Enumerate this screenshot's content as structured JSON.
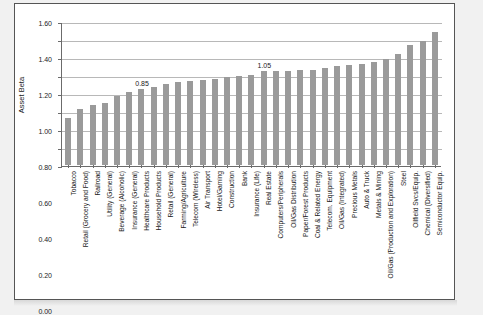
{
  "chart_data": {
    "type": "bar",
    "title": "",
    "xlabel": "",
    "ylabel": "Asset Beta",
    "ylim": [
      0.0,
      1.6
    ],
    "ytick_labels": [
      "0.00",
      "0.20",
      "0.40",
      "0.60",
      "0.80",
      "1.00",
      "1.20",
      "1.40",
      "1.60"
    ],
    "ytick_values": [
      0.0,
      0.2,
      0.4,
      0.6,
      0.8,
      1.0,
      1.2,
      1.4,
      1.6
    ],
    "grid": true,
    "legend": "none",
    "bar_color": "#9a9a9a",
    "categories": [
      "Tobacco",
      "Retail (Grocery and Food)",
      "Railroad",
      "Utility (General)",
      "Beverage (Alcoholic)",
      "Insurance (General)",
      "Healthcare Products",
      "Household Products",
      "Retail (General)",
      "Farming/Agriculture",
      "Telecom (Wireless)",
      "Air Transport",
      "Hotel/Gaming",
      "Construction",
      "Bank",
      "Insurance (Life)",
      "Real Estate",
      "Computers/Peripherals",
      "Oil/Gas Distribution",
      "Paper/Forest Products",
      "Coal & Related Energy",
      "Telecom. Equipment",
      "Oil/Gas (Integrated)",
      "Precious Metals",
      "Auto & Truck",
      "Metals & Mining",
      "Oil/Gas (Production and Exploration)",
      "Steel",
      "Oilfield Svcs/Equip.",
      "Chemical (Diversified)",
      "Semiconductor Equip."
    ],
    "values": [
      0.52,
      0.62,
      0.67,
      0.69,
      0.77,
      0.81,
      0.85,
      0.87,
      0.9,
      0.92,
      0.93,
      0.94,
      0.96,
      0.98,
      0.99,
      1.0,
      1.05,
      1.05,
      1.05,
      1.06,
      1.06,
      1.08,
      1.1,
      1.11,
      1.12,
      1.14,
      1.18,
      1.23,
      1.33,
      1.38,
      1.48
    ],
    "annotations": [
      {
        "category": "Healthcare Products",
        "label": "0.85",
        "index": 6
      },
      {
        "category": "Real Estate",
        "label": "1.05",
        "index": 16
      }
    ]
  }
}
